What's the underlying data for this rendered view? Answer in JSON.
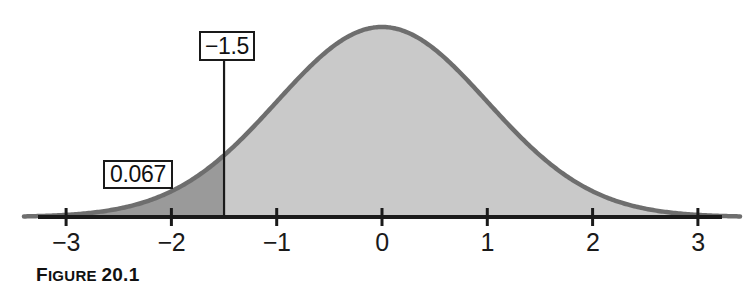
{
  "figure": {
    "caption_prefix": "F",
    "caption_rest": "IGURE ",
    "caption_number": "20.1",
    "caption_full": "FIGURE 20.1"
  },
  "colors": {
    "curve_outline": "#6e6e6e",
    "body_fill": "#c9c9c9",
    "tail_fill": "#9a9a9a",
    "axis": "#1a1a1a",
    "text": "#111111",
    "background": "#ffffff"
  },
  "callouts": [
    {
      "id": "area-label",
      "label": "0.067",
      "describes": "left-tail-area"
    },
    {
      "id": "zvalue-label",
      "label": "−1.5",
      "describes": "cutoff-line"
    }
  ],
  "chart_data": {
    "type": "area",
    "title": "",
    "subtitle": "",
    "xlabel": "",
    "ylabel": "",
    "grid": false,
    "legend": "none",
    "distribution": "standard normal",
    "mean": 0,
    "sd": 1,
    "xlim": [
      -3.4,
      3.4
    ],
    "ylim": [
      0,
      0.4
    ],
    "xticks": [
      -3,
      -2,
      -1,
      0,
      1,
      2,
      3
    ],
    "xtick_labels": [
      "−3",
      "−2",
      "−1",
      "0",
      "1",
      "2",
      "3"
    ],
    "cutoff": {
      "x": -1.5,
      "label": "−1.5",
      "line": "vertical"
    },
    "shaded_regions": [
      {
        "name": "left-tail",
        "from": -3.4,
        "to": -1.5,
        "area": 0.067,
        "label": "0.067",
        "fill": "#9a9a9a"
      },
      {
        "name": "remainder",
        "from": -1.5,
        "to": 3.4,
        "area": 0.933,
        "label": "",
        "fill": "#c9c9c9"
      }
    ],
    "x": [
      -3.4,
      -3.2,
      -3.0,
      -2.8,
      -2.6,
      -2.4,
      -2.2,
      -2.0,
      -1.8,
      -1.6,
      -1.5,
      -1.4,
      -1.2,
      -1.0,
      -0.8,
      -0.6,
      -0.4,
      -0.2,
      0.0,
      0.2,
      0.4,
      0.6,
      0.8,
      1.0,
      1.2,
      1.4,
      1.6,
      1.8,
      2.0,
      2.2,
      2.4,
      2.6,
      2.8,
      3.0,
      3.2,
      3.4
    ],
    "y": [
      0.0012,
      0.0024,
      0.0044,
      0.0079,
      0.0136,
      0.0224,
      0.0355,
      0.054,
      0.079,
      0.1109,
      0.1295,
      0.1497,
      0.1942,
      0.242,
      0.2897,
      0.3332,
      0.3683,
      0.391,
      0.3989,
      0.391,
      0.3683,
      0.3332,
      0.2897,
      0.242,
      0.1942,
      0.1497,
      0.1109,
      0.079,
      0.054,
      0.0355,
      0.0224,
      0.0136,
      0.0079,
      0.0044,
      0.0024,
      0.0012
    ]
  },
  "axis_labels": [
    {
      "value": -3,
      "text": "−3"
    },
    {
      "value": -2,
      "text": "−2"
    },
    {
      "value": -1,
      "text": "−1"
    },
    {
      "value": 0,
      "text": "0"
    },
    {
      "value": 1,
      "text": "1"
    },
    {
      "value": 2,
      "text": "2"
    },
    {
      "value": 3,
      "text": "3"
    }
  ]
}
